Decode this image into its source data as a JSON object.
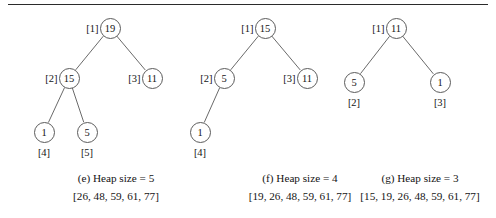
{
  "figure": {
    "type": "heapsort-trace-diagram",
    "horizontal_rule": true,
    "panels": [
      {
        "id": "e",
        "caption": "(e) Heap size = 5",
        "array_text": "[26, 48, 59, 61, 77]",
        "nodes": [
          {
            "value": "19",
            "index_label": "[1]",
            "cx": 110,
            "cy": 28,
            "label_pos": "left"
          },
          {
            "value": "15",
            "index_label": "[2]",
            "cx": 69,
            "cy": 78,
            "label_pos": "left"
          },
          {
            "value": "11",
            "index_label": "[3]",
            "cx": 152,
            "cy": 78,
            "label_pos": "left"
          },
          {
            "value": "1",
            "index_label": "[4]",
            "cx": 44,
            "cy": 132,
            "label_pos": "below"
          },
          {
            "value": "5",
            "index_label": "[5]",
            "cx": 87,
            "cy": 132,
            "label_pos": "below"
          }
        ],
        "edges": [
          [
            0,
            1
          ],
          [
            0,
            2
          ],
          [
            1,
            3
          ],
          [
            1,
            4
          ]
        ]
      },
      {
        "id": "f",
        "caption": "(f) Heap size = 4",
        "array_text": "[19, 26, 48, 59, 61, 77]",
        "nodes": [
          {
            "value": "15",
            "index_label": "[1]",
            "cx": 265,
            "cy": 28,
            "label_pos": "left"
          },
          {
            "value": "5",
            "index_label": "[2]",
            "cx": 224,
            "cy": 78,
            "label_pos": "left"
          },
          {
            "value": "11",
            "index_label": "[3]",
            "cx": 307,
            "cy": 78,
            "label_pos": "left"
          },
          {
            "value": "1",
            "index_label": "[4]",
            "cx": 200,
            "cy": 132,
            "label_pos": "below"
          }
        ],
        "edges": [
          [
            0,
            1
          ],
          [
            0,
            2
          ],
          [
            1,
            3
          ]
        ]
      },
      {
        "id": "g",
        "caption": "(g) Heap size = 3",
        "array_text": "[15, 19, 26, 48, 59, 61, 77]",
        "nodes": [
          {
            "value": "11",
            "index_label": "[1]",
            "cx": 396,
            "cy": 28,
            "label_pos": "left"
          },
          {
            "value": "5",
            "index_label": "[2]",
            "cx": 354,
            "cy": 82,
            "label_pos": "below"
          },
          {
            "value": "1",
            "index_label": "[3]",
            "cx": 440,
            "cy": 82,
            "label_pos": "below"
          }
        ],
        "edges": [
          [
            0,
            1
          ],
          [
            0,
            2
          ]
        ]
      }
    ],
    "caption_row_y": 172,
    "array_row_y": 190,
    "caption_centers": [
      116,
      300,
      420
    ]
  }
}
